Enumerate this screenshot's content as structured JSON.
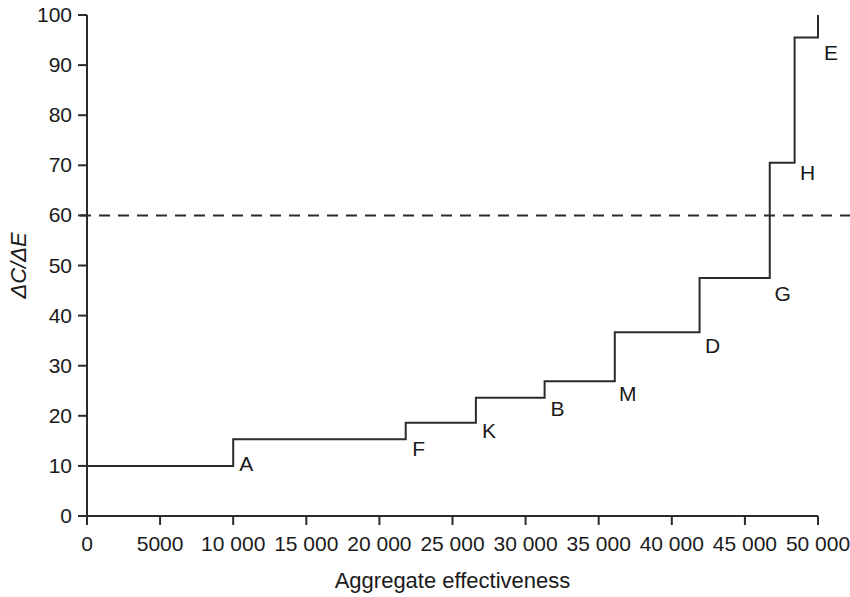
{
  "chart_data": {
    "type": "line",
    "subtype": "step",
    "title": "",
    "xlabel": "Aggregate effectiveness",
    "ylabel": "ΔC/ΔE",
    "xlim": [
      0,
      50000
    ],
    "ylim": [
      0,
      100
    ],
    "grid": false,
    "legend": null,
    "x_ticks": [
      0,
      5000,
      10000,
      15000,
      20000,
      25000,
      30000,
      35000,
      40000,
      45000,
      50000
    ],
    "x_tick_labels": [
      "0",
      "5000",
      "10 000",
      "15 000",
      "20 000",
      "25 000",
      "30 000",
      "35 000",
      "40 000",
      "45 000",
      "50 000"
    ],
    "y_ticks": [
      0,
      10,
      20,
      30,
      40,
      50,
      60,
      70,
      80,
      90,
      100
    ],
    "y_tick_labels": [
      "0",
      "10",
      "20",
      "30",
      "40",
      "50",
      "60",
      "70",
      "80",
      "90",
      "100"
    ],
    "annotations": [
      {
        "label": "threshold",
        "type": "hline",
        "y": 60,
        "style": "dashed",
        "text": ""
      }
    ],
    "series": [
      {
        "name": "Cost-effectiveness frontier",
        "style": "step-post",
        "steps": [
          {
            "label": "",
            "x_start": 0,
            "x_end": 10000,
            "value": 10.0
          },
          {
            "label": "A",
            "x_start": 10000,
            "x_end": 21800,
            "value": 15.3
          },
          {
            "label": "F",
            "x_start": 21800,
            "x_end": 26600,
            "value": 18.6
          },
          {
            "label": "K",
            "x_start": 26600,
            "x_end": 31300,
            "value": 23.6
          },
          {
            "label": "B",
            "x_start": 31300,
            "x_end": 36100,
            "value": 26.9
          },
          {
            "label": "M",
            "x_start": 36100,
            "x_end": 41900,
            "value": 36.7
          },
          {
            "label": "D",
            "x_start": 41900,
            "x_end": 46700,
            "value": 47.5
          },
          {
            "label": "G",
            "x_start": 46700,
            "x_end": 48400,
            "value": 70.5
          },
          {
            "label": "H",
            "x_start": 48400,
            "x_end": 50000,
            "value": 95.5
          },
          {
            "label": "E",
            "x_start": 50000,
            "x_end": 50000,
            "value": 100.0
          }
        ],
        "point_labels": [
          {
            "text": "A",
            "x": 10000,
            "y": 9.0
          },
          {
            "text": "F",
            "x": 21800,
            "y": 12.0
          },
          {
            "text": "K",
            "x": 26600,
            "y": 15.5
          },
          {
            "text": "B",
            "x": 31300,
            "y": 20.0
          },
          {
            "text": "M",
            "x": 36100,
            "y": 23.0
          },
          {
            "text": "D",
            "x": 41900,
            "y": 32.5
          },
          {
            "text": "G",
            "x": 46700,
            "y": 43.0
          },
          {
            "text": "H",
            "x": 48400,
            "y": 67.0
          },
          {
            "text": "E",
            "x": 50000,
            "y": 91.0
          }
        ]
      }
    ]
  },
  "figure": {
    "background_color": "#ffffff",
    "line_color": "#2b2b2b",
    "text_color": "#1a1a1a"
  }
}
